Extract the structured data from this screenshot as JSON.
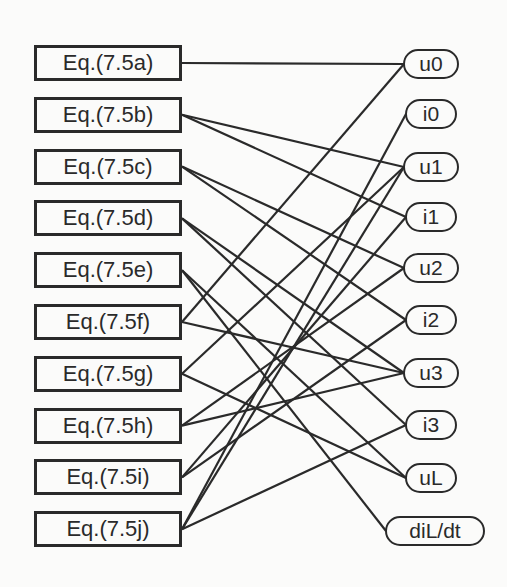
{
  "diagram": {
    "equations": [
      "Eq.(7.5a)",
      "Eq.(7.5b)",
      "Eq.(7.5c)",
      "Eq.(7.5d)",
      "Eq.(7.5e)",
      "Eq.(7.5f)",
      "Eq.(7.5g)",
      "Eq.(7.5h)",
      "Eq.(7.5i)",
      "Eq.(7.5j)"
    ],
    "variables": [
      "u0",
      "i0",
      "u1",
      "i1",
      "u2",
      "i2",
      "u3",
      "i3",
      "uL",
      "diL/dt"
    ],
    "edges": [
      [
        0,
        0
      ],
      [
        1,
        2
      ],
      [
        1,
        3
      ],
      [
        2,
        4
      ],
      [
        2,
        5
      ],
      [
        3,
        6
      ],
      [
        3,
        7
      ],
      [
        4,
        8
      ],
      [
        4,
        9
      ],
      [
        5,
        0
      ],
      [
        5,
        6
      ],
      [
        6,
        2
      ],
      [
        6,
        8
      ],
      [
        7,
        4
      ],
      [
        7,
        6
      ],
      [
        8,
        3
      ],
      [
        8,
        5
      ],
      [
        9,
        1
      ],
      [
        9,
        2
      ],
      [
        9,
        7
      ]
    ],
    "line_color": "#2a2a2a"
  }
}
